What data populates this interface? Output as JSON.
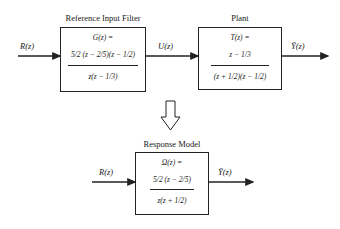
{
  "top_row": {
    "input_signal": "R(z)",
    "filter": {
      "title": "Reference Input Filter",
      "lhs": "G(z) =",
      "numerator": "5/2 (z − 2/5)(z − 1/2)",
      "denominator": "z(z − 1/3)"
    },
    "intermediate_signal": "U(z)",
    "plant": {
      "title": "Plant",
      "lhs": "T(z) =",
      "numerator": "z − 1/3",
      "denominator": "(z + 1/2)(z − 1/2)"
    },
    "output_signal": "Ȳ(z)"
  },
  "transform_arrow": "hollow-down-arrow",
  "bottom_row": {
    "input_signal": "R(z)",
    "model": {
      "title": "Response Model",
      "lhs": "Ω(z) =",
      "numerator": "5/2 (z − 2/5)",
      "denominator": "z(z + 1/2)"
    },
    "output_signal": "Ȳ(z)"
  }
}
